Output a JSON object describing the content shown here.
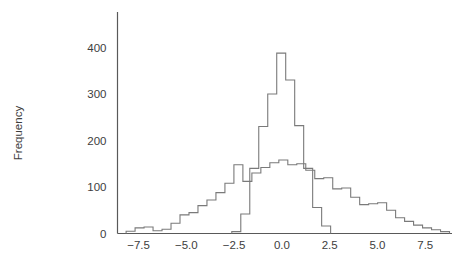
{
  "chart_data": {
    "type": "line",
    "subtype": "step-histogram-outline",
    "title": "",
    "subtitle": "",
    "xlabel": "",
    "ylabel": "Frequency",
    "xlim": [
      -8.6,
      8.9
    ],
    "ylim": [
      0,
      420
    ],
    "grid": false,
    "legend": "none",
    "yticks": [
      0,
      100,
      200,
      300,
      400
    ],
    "ytick_labels": [
      "0",
      "100",
      "200",
      "300",
      "400"
    ],
    "xticks": [
      -7.5,
      -5.0,
      -2.5,
      0.0,
      2.5,
      5.0,
      7.5
    ],
    "xtick_labels": [
      "−7.5",
      "−5.0",
      "−2.5",
      "0.0",
      "2.5",
      "5.0",
      "7.5"
    ],
    "bin_width": 0.47,
    "series": [
      {
        "name": "broad-distribution",
        "bin_edges": [
          -8.15,
          -7.68,
          -7.21,
          -6.74,
          -6.27,
          -5.8,
          -5.33,
          -4.86,
          -4.39,
          -3.92,
          -3.45,
          -2.98,
          -2.51,
          -2.04,
          -1.57,
          -1.1,
          -0.63,
          -0.16,
          0.31,
          0.78,
          1.25,
          1.72,
          2.19,
          2.66,
          3.13,
          3.6,
          4.07,
          4.54,
          5.01,
          5.48,
          5.95,
          6.42,
          6.89,
          7.36,
          7.83,
          8.3,
          8.77
        ],
        "values": [
          5,
          12,
          14,
          6,
          9,
          22,
          40,
          45,
          60,
          72,
          88,
          108,
          148,
          112,
          130,
          142,
          152,
          158,
          148,
          150,
          136,
          118,
          120,
          96,
          98,
          78,
          62,
          64,
          66,
          50,
          34,
          26,
          18,
          12,
          8,
          4
        ]
      },
      {
        "name": "narrow-distribution",
        "bin_edges": [
          -2.62,
          -2.15,
          -1.68,
          -1.21,
          -0.74,
          -0.27,
          0.2,
          0.67,
          1.14,
          1.61,
          2.08,
          2.55
        ],
        "values": [
          4,
          42,
          140,
          230,
          300,
          388,
          330,
          232,
          140,
          56,
          16
        ]
      }
    ]
  },
  "axes": {
    "y_axis_label": "Frequency"
  }
}
